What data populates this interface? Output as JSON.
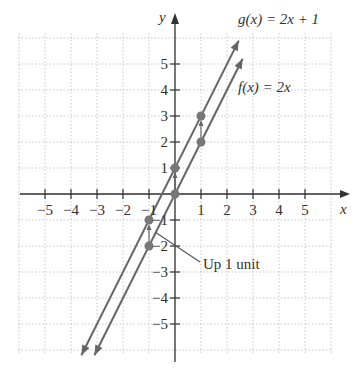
{
  "chart_data": {
    "type": "line",
    "title": "",
    "xlabel": "x",
    "ylabel": "y",
    "xlim": [
      -6,
      6
    ],
    "ylim": [
      -6,
      6
    ],
    "grid": true,
    "x_ticks": [
      "-5",
      "-4",
      "-3",
      "-2",
      "-1",
      "1",
      "2",
      "3",
      "4",
      "5"
    ],
    "y_ticks": [
      "5",
      "4",
      "3",
      "2",
      "1",
      "-1",
      "-2",
      "-3",
      "-4",
      "-5"
    ],
    "series": [
      {
        "name": "g(x) = 2x + 1",
        "label": "g(x) = 2x + 1",
        "points": [
          [
            -1,
            -1
          ],
          [
            0,
            1
          ],
          [
            1,
            3
          ]
        ],
        "color": "#666666"
      },
      {
        "name": "f(x) = 2x",
        "label": "f(x) = 2x",
        "points": [
          [
            -1,
            -2
          ],
          [
            0,
            0
          ],
          [
            1,
            2
          ]
        ],
        "color": "#666666"
      }
    ],
    "annotations": [
      {
        "text": "Up 1 unit",
        "points_to": [
          -1,
          -1.5
        ]
      }
    ]
  },
  "labels": {
    "g": "g(x) = 2x + 1",
    "f": "f(x) = 2x",
    "annotation": "Up 1 unit",
    "x_axis": "x",
    "y_axis": "y"
  }
}
